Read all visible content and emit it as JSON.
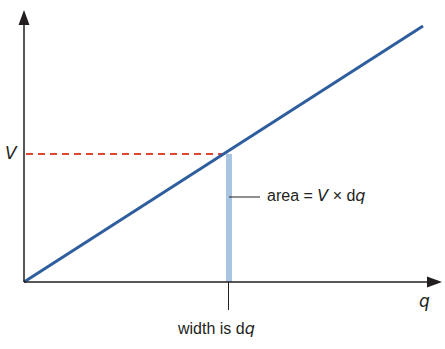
{
  "diagram": {
    "title": "",
    "axes": {
      "x_label": "q",
      "y_label_level": "V"
    },
    "annotations": {
      "area_prefix": "area = ",
      "area_V": "V",
      "area_times": " × d",
      "area_q": "q",
      "width_prefix": "width is d",
      "width_q": "q"
    },
    "colors": {
      "line": "#2e5e9e",
      "dashed": "#e0452e",
      "strip": "#a9c4e0",
      "axes": "#231f20"
    }
  }
}
